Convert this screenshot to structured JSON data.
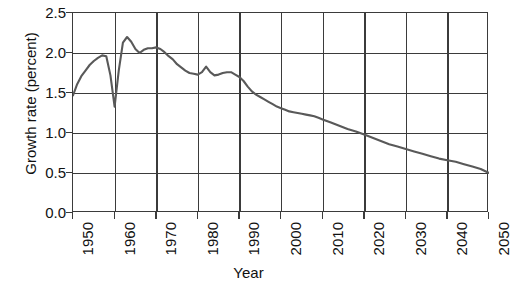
{
  "chart_data": {
    "type": "line",
    "title": "",
    "xlabel": "Year",
    "ylabel": "Growth rate (percent)",
    "xlim": [
      1950,
      2050
    ],
    "ylim": [
      0.0,
      2.5
    ],
    "grid": true,
    "legend": null,
    "xticks": [
      "1950",
      "1960",
      "1970",
      "1980",
      "1990",
      "2000",
      "2010",
      "2020",
      "2030",
      "2040",
      "2050"
    ],
    "yticks": [
      "0.0",
      "0.5",
      "1.0",
      "1.5",
      "2.0",
      "2.5"
    ],
    "line_color": "#595959",
    "series": [
      {
        "name": "World population growth rate",
        "x": [
          1950,
          1951,
          1952,
          1953,
          1954,
          1955,
          1956,
          1957,
          1958,
          1959,
          1960,
          1961,
          1962,
          1963,
          1964,
          1965,
          1966,
          1967,
          1968,
          1969,
          1970,
          1971,
          1972,
          1973,
          1974,
          1975,
          1976,
          1977,
          1978,
          1979,
          1980,
          1981,
          1982,
          1983,
          1984,
          1985,
          1986,
          1987,
          1988,
          1989,
          1990,
          1991,
          1992,
          1993,
          1994,
          1995,
          1996,
          1997,
          1998,
          1999,
          2000,
          2001,
          2002,
          2003,
          2004,
          2005,
          2006,
          2007,
          2008,
          2009,
          2010,
          2012,
          2014,
          2016,
          2018,
          2020,
          2022,
          2024,
          2026,
          2028,
          2030,
          2032,
          2034,
          2036,
          2038,
          2040,
          2042,
          2044,
          2046,
          2048,
          2050
        ],
        "y": [
          1.47,
          1.61,
          1.71,
          1.78,
          1.85,
          1.9,
          1.94,
          1.97,
          1.96,
          1.72,
          1.33,
          1.78,
          2.13,
          2.2,
          2.14,
          2.05,
          2.0,
          2.04,
          2.06,
          2.06,
          2.07,
          2.05,
          2.01,
          1.96,
          1.92,
          1.86,
          1.82,
          1.78,
          1.75,
          1.74,
          1.73,
          1.76,
          1.83,
          1.76,
          1.72,
          1.73,
          1.75,
          1.76,
          1.76,
          1.73,
          1.7,
          1.65,
          1.58,
          1.52,
          1.48,
          1.45,
          1.42,
          1.39,
          1.36,
          1.33,
          1.31,
          1.29,
          1.27,
          1.26,
          1.25,
          1.24,
          1.23,
          1.22,
          1.21,
          1.19,
          1.17,
          1.13,
          1.09,
          1.05,
          1.02,
          0.98,
          0.94,
          0.9,
          0.86,
          0.83,
          0.8,
          0.77,
          0.74,
          0.71,
          0.68,
          0.66,
          0.64,
          0.61,
          0.58,
          0.55,
          0.5
        ]
      }
    ]
  }
}
